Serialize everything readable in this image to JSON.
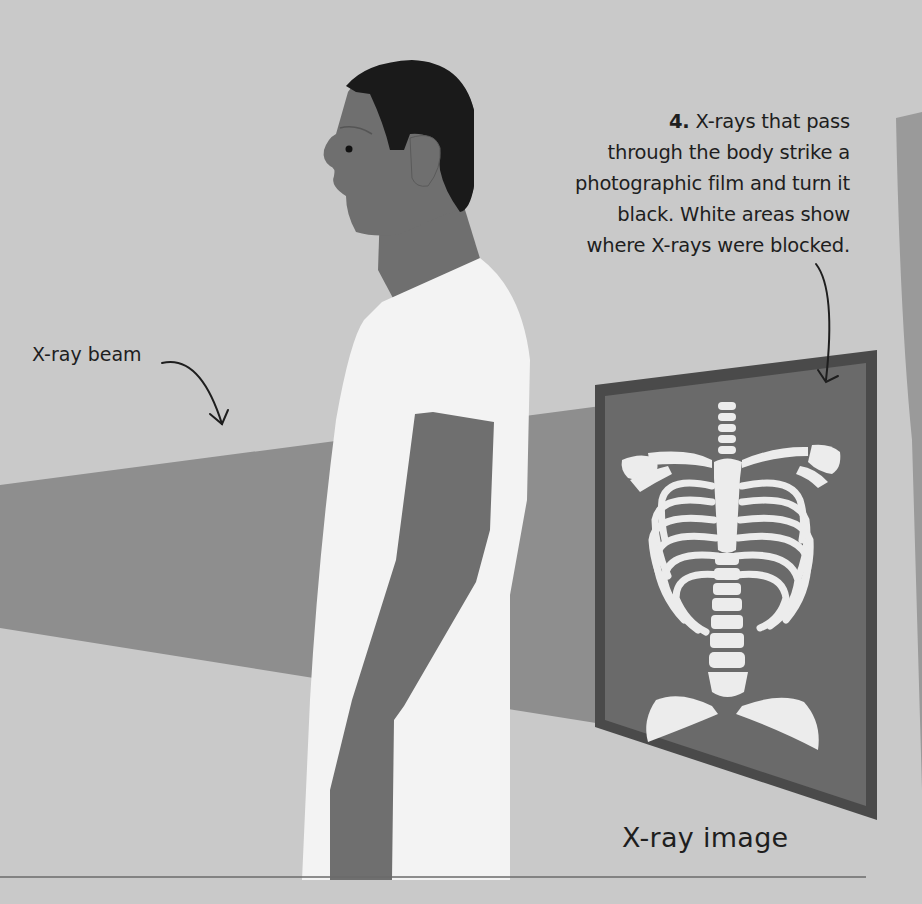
{
  "annotations": {
    "step4": {
      "number": "4.",
      "text": "X-rays that pass through the body strike a photographic film and turn it black. White areas show where X-rays were blocked.",
      "lines": [
        "X-rays that pass",
        "through the body strike a",
        "photographic film and turn it",
        "black. White areas show",
        "where X-rays were blocked."
      ]
    },
    "beam_label": "X-ray beam",
    "image_label": "X-ray image"
  },
  "illustration": {
    "subjects": [
      "person-profile",
      "x-ray-beam",
      "x-ray-film-panel",
      "ribcage-skeleton",
      "spine",
      "pelvis"
    ],
    "colors": {
      "background": "#c9c9c9",
      "beam": "#8e8e8e",
      "skin": "#6f6f6f",
      "hair": "#1a1a1a",
      "gown": "#f3f3f3",
      "film_frame": "#4a4a4a",
      "film": "#6a6a6a",
      "bone": "#ececec",
      "machine": "#9a9a9a",
      "floor_line": "#6a6a6a"
    }
  }
}
